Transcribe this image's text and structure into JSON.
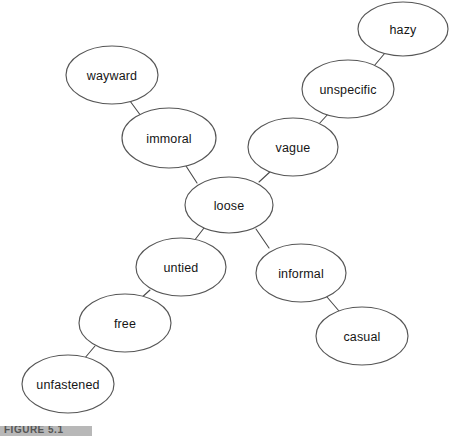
{
  "figure": {
    "caption_partial": "FIGURE 5.1",
    "background_color": "#ffffff",
    "node_fill_color": "#ffffff",
    "node_stroke_color": "#565656",
    "edge_stroke_color": "#4a4a4a",
    "label_color": "#161616"
  },
  "graph": {
    "type": "node-link-network",
    "center_node": "loose",
    "node_count": 10,
    "edge_count": 9,
    "nodes": [
      {
        "id": "loose",
        "label": "loose",
        "cx": 229,
        "cy": 205,
        "rx": 44,
        "ry": 28
      },
      {
        "id": "immoral",
        "label": "immoral",
        "cx": 169,
        "cy": 138,
        "rx": 47,
        "ry": 30
      },
      {
        "id": "wayward",
        "label": "wayward",
        "cx": 112,
        "cy": 75,
        "rx": 46,
        "ry": 29
      },
      {
        "id": "vague",
        "label": "vague",
        "cx": 293,
        "cy": 147,
        "rx": 45,
        "ry": 29
      },
      {
        "id": "unspecific",
        "label": "unspecific",
        "cx": 348,
        "cy": 89,
        "rx": 46,
        "ry": 29
      },
      {
        "id": "hazy",
        "label": "hazy",
        "cx": 403,
        "cy": 29,
        "rx": 45,
        "ry": 27
      },
      {
        "id": "untied",
        "label": "untied",
        "cx": 181,
        "cy": 267,
        "rx": 45,
        "ry": 29
      },
      {
        "id": "free",
        "label": "free",
        "cx": 125,
        "cy": 323,
        "rx": 46,
        "ry": 29
      },
      {
        "id": "unfastened",
        "label": "unfastened",
        "cx": 68,
        "cy": 384,
        "rx": 46,
        "ry": 29
      },
      {
        "id": "informal",
        "label": "informal",
        "cx": 301,
        "cy": 273,
        "rx": 45,
        "ry": 29
      },
      {
        "id": "casual",
        "label": "casual",
        "cx": 362,
        "cy": 336,
        "rx": 46,
        "ry": 29
      }
    ],
    "edges": [
      {
        "from": "loose",
        "to": "immoral",
        "x1": 197,
        "y1": 183,
        "x2": 186,
        "y2": 166
      },
      {
        "from": "immoral",
        "to": "wayward",
        "x1": 141,
        "y1": 116,
        "x2": 130,
        "y2": 101
      },
      {
        "from": "loose",
        "to": "vague",
        "x1": 259,
        "y1": 182,
        "x2": 272,
        "y2": 170
      },
      {
        "from": "vague",
        "to": "unspecific",
        "x1": 318,
        "y1": 125,
        "x2": 329,
        "y2": 113
      },
      {
        "from": "unspecific",
        "to": "hazy",
        "x1": 374,
        "y1": 66,
        "x2": 385,
        "y2": 53
      },
      {
        "from": "loose",
        "to": "untied",
        "x1": 204,
        "y1": 228,
        "x2": 194,
        "y2": 241
      },
      {
        "from": "untied",
        "to": "free",
        "x1": 150,
        "y1": 290,
        "x2": 139,
        "y2": 300
      },
      {
        "from": "free",
        "to": "unfastened",
        "x1": 95,
        "y1": 346,
        "x2": 84,
        "y2": 359
      },
      {
        "from": "loose",
        "to": "informal",
        "x1": 256,
        "y1": 229,
        "x2": 269,
        "y2": 248
      },
      {
        "from": "informal",
        "to": "casual",
        "x1": 327,
        "y1": 297,
        "x2": 339,
        "y2": 311
      }
    ]
  }
}
